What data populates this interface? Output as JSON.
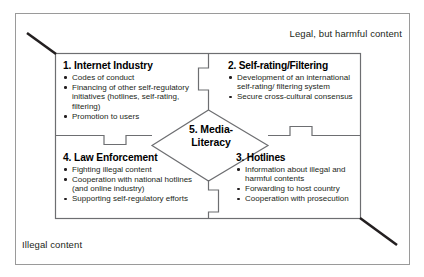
{
  "figure": {
    "name": "internet-content-regulation-puzzle-diagram",
    "outer_labels": {
      "top_right": "Legal, but harmful content",
      "bottom_left": "Illegal content"
    },
    "center": {
      "line1": "5. Media-",
      "line2": "Literacy"
    },
    "quadrants": [
      {
        "id": "internet-industry",
        "title": "1. Internet Industry",
        "bullets": [
          "Codes of conduct",
          "Financing of other self-regulatory initiatives (hotlines, self-rating, filtering)",
          "Promotion to users"
        ]
      },
      {
        "id": "self-rating-filtering",
        "title": "2. Self-rating/Filtering",
        "bullets": [
          "Development of an international self-rating/ filtering system",
          "Secure cross-cultural consensus"
        ]
      },
      {
        "id": "hotlines",
        "title": "3. Hotlines",
        "bullets": [
          "Information about illegal and harmful contents",
          "Forwarding to host country",
          "Cooperation with prosecution"
        ]
      },
      {
        "id": "law-enforcement",
        "title": "4. Law Enforcement",
        "bullets": [
          "Fighting illegal content",
          "Cooperation with national hotlines (and online industry)",
          "Supporting self-regulatory efforts"
        ]
      }
    ],
    "colors": {
      "text": "#231f20",
      "line": "#6d6e71",
      "accent_line": "#231f20",
      "background": "#ffffff"
    }
  }
}
